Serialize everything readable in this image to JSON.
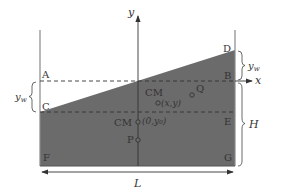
{
  "diagram": {
    "axes": {
      "x_label": "x",
      "y_label": "y"
    },
    "points": {
      "A": "A",
      "B": "B",
      "C": "C",
      "D": "D",
      "E": "E",
      "F": "F",
      "G": "G",
      "P": "P",
      "Q": "Q"
    },
    "cm_labels": {
      "cm_upper": "CM",
      "cm_upper_coords": "(x,y)",
      "cm_lower": "CM",
      "cm_lower_coords": "(0,y₀)"
    },
    "dimensions": {
      "left_brace": "y_w",
      "right_brace_top": "y_w",
      "right_brace_bottom": "H",
      "width": "L"
    },
    "colors": {
      "fill": "#6b6b6b",
      "line": "#444444",
      "background": "#ffffff"
    }
  }
}
